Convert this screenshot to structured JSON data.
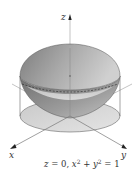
{
  "figure": {
    "type": "3d-surface-diagram",
    "axes": {
      "x_label": "x",
      "y_label": "y",
      "z_label": "z"
    },
    "caption": {
      "z_part": "z",
      "eq1": " = 0, ",
      "x_part": "x",
      "sup1": "2",
      "plus": " + ",
      "y_part": "y",
      "sup2": "2",
      "eq2": " = 1",
      "full_text": "z = 0, x² + y² = 1"
    },
    "colors": {
      "surface_dark": "#8a8a8a",
      "surface_light": "#d9d9d9",
      "disk_fill": "#d4d4d4",
      "axis_line": "#999999",
      "edge": "#555555",
      "dashed_curve": "#333333"
    }
  }
}
